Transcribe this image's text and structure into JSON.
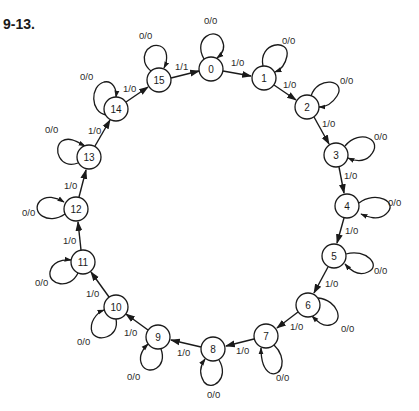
{
  "figure": {
    "label": "9-13."
  },
  "diagram": {
    "type": "state-diagram",
    "nodes": [
      {
        "id": "0",
        "label": "0",
        "x": 211,
        "y": 69
      },
      {
        "id": "1",
        "label": "1",
        "x": 264,
        "y": 78
      },
      {
        "id": "2",
        "label": "2",
        "x": 307,
        "y": 107
      },
      {
        "id": "3",
        "label": "3",
        "x": 336,
        "y": 155
      },
      {
        "id": "4",
        "label": "4",
        "x": 347,
        "y": 206
      },
      {
        "id": "5",
        "label": "5",
        "x": 334,
        "y": 256
      },
      {
        "id": "6",
        "label": "6",
        "x": 308,
        "y": 305
      },
      {
        "id": "7",
        "label": "7",
        "x": 266,
        "y": 336
      },
      {
        "id": "8",
        "label": "8",
        "x": 213,
        "y": 349
      },
      {
        "id": "9",
        "label": "9",
        "x": 158,
        "y": 337
      },
      {
        "id": "10",
        "label": "10",
        "x": 116,
        "y": 307
      },
      {
        "id": "11",
        "label": "11",
        "x": 83,
        "y": 262
      },
      {
        "id": "12",
        "label": "12",
        "x": 76,
        "y": 209
      },
      {
        "id": "13",
        "label": "13",
        "x": 89,
        "y": 157
      },
      {
        "id": "14",
        "label": "14",
        "x": 116,
        "y": 109
      },
      {
        "id": "15",
        "label": "15",
        "x": 159,
        "y": 80
      }
    ],
    "transitions": [
      {
        "from": "0",
        "to": "1",
        "label": "1/0"
      },
      {
        "from": "1",
        "to": "2",
        "label": "1/0"
      },
      {
        "from": "2",
        "to": "3",
        "label": "1/0"
      },
      {
        "from": "3",
        "to": "4",
        "label": "1/0"
      },
      {
        "from": "4",
        "to": "5",
        "label": "1/0"
      },
      {
        "from": "5",
        "to": "6",
        "label": "1/0"
      },
      {
        "from": "6",
        "to": "7",
        "label": "1/0"
      },
      {
        "from": "7",
        "to": "8",
        "label": "1/0"
      },
      {
        "from": "8",
        "to": "9",
        "label": "1/0"
      },
      {
        "from": "9",
        "to": "10",
        "label": "1/0"
      },
      {
        "from": "10",
        "to": "11",
        "label": "1/0"
      },
      {
        "from": "11",
        "to": "12",
        "label": "1/0"
      },
      {
        "from": "12",
        "to": "13",
        "label": "1/0"
      },
      {
        "from": "13",
        "to": "14",
        "label": "1/0"
      },
      {
        "from": "14",
        "to": "15",
        "label": "1/0"
      },
      {
        "from": "15",
        "to": "0",
        "label": "1/1"
      }
    ],
    "self_loops": [
      {
        "node": "0",
        "label": "0/0"
      },
      {
        "node": "1",
        "label": "0/0"
      },
      {
        "node": "2",
        "label": "0/0"
      },
      {
        "node": "3",
        "label": "0/0"
      },
      {
        "node": "4",
        "label": "0/0"
      },
      {
        "node": "5",
        "label": "0/0"
      },
      {
        "node": "6",
        "label": "0/0"
      },
      {
        "node": "7",
        "label": "0/0"
      },
      {
        "node": "8",
        "label": "0/0"
      },
      {
        "node": "9",
        "label": "0/0"
      },
      {
        "node": "10",
        "label": "0/0"
      },
      {
        "node": "11",
        "label": "0/0"
      },
      {
        "node": "12",
        "label": "0/0"
      },
      {
        "node": "13",
        "label": "0/0"
      },
      {
        "node": "14",
        "label": "0/0"
      },
      {
        "node": "15",
        "label": "0/0"
      }
    ]
  }
}
